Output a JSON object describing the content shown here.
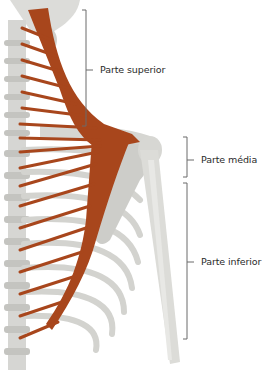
{
  "figure": {
    "colors": {
      "muscle": "#a8461c",
      "muscle_dark": "#8a3512",
      "bone": "#d9d9d6",
      "bone_shade": "#b9b9b5",
      "bracket": "#6b6b6b",
      "text": "#2a2a2a"
    },
    "labels": [
      {
        "id": "upper",
        "text": "Parte superior"
      },
      {
        "id": "middle",
        "text": "Parte média"
      },
      {
        "id": "lower",
        "text": "Parte inferior"
      }
    ]
  }
}
